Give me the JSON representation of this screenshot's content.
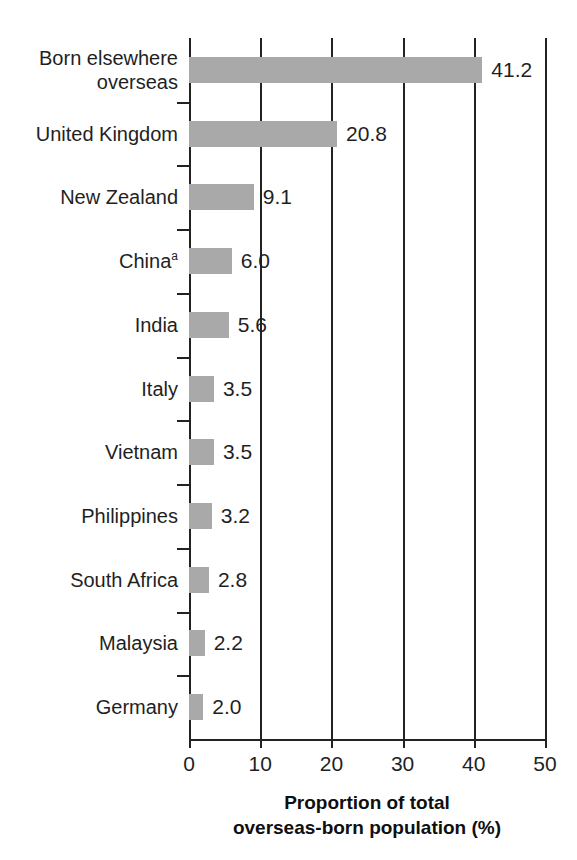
{
  "chart_data": {
    "type": "bar",
    "orientation": "horizontal",
    "title": "",
    "xlabel_lines": [
      "Proportion of total",
      "overseas-born population (%)"
    ],
    "ylabel": "",
    "xlim": [
      0,
      50
    ],
    "xticks": [
      0,
      10,
      20,
      30,
      40,
      50
    ],
    "xtick_labels": [
      "0",
      "10",
      "20",
      "30",
      "40",
      "50"
    ],
    "grid": true,
    "grid_axis": "x",
    "legend": "none",
    "bar_color": "#a9a9a9",
    "axis_color": "#222222",
    "categories": [
      "Born elsewhere\noverseas",
      "United Kingdom",
      "New Zealand",
      "China",
      "India",
      "Italy",
      "Vietnam",
      "Philippines",
      "South Africa",
      "Malaysia",
      "Germany"
    ],
    "category_footnotes": [
      "",
      "",
      "",
      "a",
      "",
      "",
      "",
      "",
      "",
      "",
      ""
    ],
    "values": [
      41.2,
      20.8,
      9.1,
      6.0,
      5.6,
      3.5,
      3.5,
      3.2,
      2.8,
      2.2,
      2.0
    ],
    "value_labels": [
      "41.2",
      "20.8",
      "9.1",
      "6.0",
      "5.6",
      "3.5",
      "3.5",
      "3.2",
      "2.8",
      "2.2",
      "2.0"
    ]
  }
}
